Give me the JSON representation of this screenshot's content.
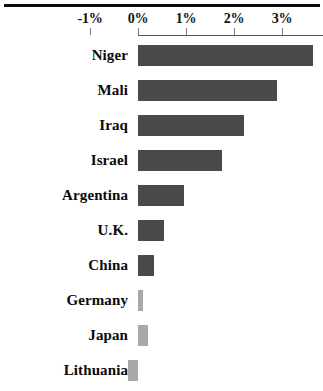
{
  "title_fragment": "",
  "axis": {
    "tick_labels": [
      "-1%",
      "0%",
      "1%",
      "2%",
      "3%"
    ],
    "tick_values": [
      -1,
      0,
      1,
      2,
      3
    ],
    "zero_label": "0%"
  },
  "colors": {
    "bar_dark": "#4a4a4a",
    "bar_light": "#a8a8a8",
    "rule": "#0d0d0d",
    "axis": "#555555",
    "tick": "#777777",
    "label_text": "#0a0a0a",
    "background": "#ffffff"
  },
  "chart_data": {
    "type": "bar",
    "orientation": "horizontal",
    "title": "",
    "subtitle": "",
    "xlabel": "",
    "ylabel": "",
    "xlim": [
      -1.3,
      3.85
    ],
    "grid": false,
    "legend": "none",
    "value_format": "percent",
    "xticks": [
      -1,
      0,
      1,
      2,
      3
    ],
    "xticklabels": [
      "-1%",
      "0%",
      "1%",
      "2%",
      "3%"
    ],
    "categories": [
      "Niger",
      "Mali",
      "Iraq",
      "Israel",
      "Argentina",
      "U.K.",
      "China",
      "Germany",
      "Japan",
      "Lithuania"
    ],
    "values": [
      3.65,
      2.9,
      2.2,
      1.75,
      0.95,
      0.55,
      0.33,
      0.1,
      0.2,
      -0.2
    ],
    "bar_colors": [
      "#4a4a4a",
      "#4a4a4a",
      "#4a4a4a",
      "#4a4a4a",
      "#4a4a4a",
      "#4a4a4a",
      "#4a4a4a",
      "#a8a8a8",
      "#a8a8a8",
      "#a8a8a8"
    ],
    "note": "Niger bar is clipped at the right edge of the image; Lithuania bar extends left of zero (negative) and is clipped at the bottom of the image."
  },
  "rows": [
    {
      "label": "Niger",
      "value": 3.65,
      "tone": "dark"
    },
    {
      "label": "Mali",
      "value": 2.9,
      "tone": "dark"
    },
    {
      "label": "Iraq",
      "value": 2.2,
      "tone": "dark"
    },
    {
      "label": "Israel",
      "value": 1.75,
      "tone": "dark"
    },
    {
      "label": "Argentina",
      "value": 0.95,
      "tone": "dark"
    },
    {
      "label": "U.K.",
      "value": 0.55,
      "tone": "dark"
    },
    {
      "label": "China",
      "value": 0.33,
      "tone": "dark"
    },
    {
      "label": "Germany",
      "value": 0.1,
      "tone": "light"
    },
    {
      "label": "Japan",
      "value": 0.2,
      "tone": "light"
    },
    {
      "label": "Lithuania",
      "value": -0.2,
      "tone": "light"
    }
  ]
}
